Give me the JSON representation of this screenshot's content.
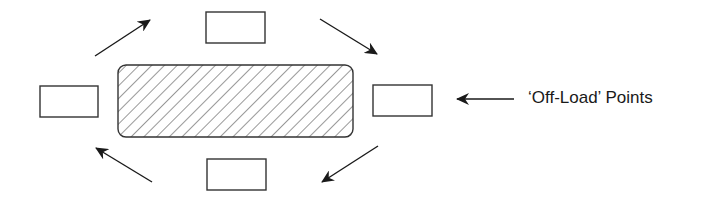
{
  "diagram": {
    "title": "",
    "label": "‘Off-Load’ Points",
    "colors": {
      "stroke": "#333333",
      "hatch": "#444444",
      "background": "#ffffff"
    },
    "central_area": {
      "x": 118,
      "y": 65,
      "width": 235,
      "height": 72,
      "radius": 8,
      "fill": "diagonal-hatch"
    },
    "offload_points": [
      {
        "id": "top",
        "x": 206,
        "y": 12,
        "width": 59,
        "height": 31
      },
      {
        "id": "left",
        "x": 40,
        "y": 86,
        "width": 58,
        "height": 31
      },
      {
        "id": "right",
        "x": 373,
        "y": 85,
        "width": 59,
        "height": 31
      },
      {
        "id": "bottom",
        "x": 207,
        "y": 159,
        "width": 59,
        "height": 31
      }
    ],
    "flow_arrows": [
      {
        "id": "top-left",
        "x1": 95,
        "y1": 56,
        "x2": 150,
        "y2": 20
      },
      {
        "id": "top-right",
        "x1": 320,
        "y1": 19,
        "x2": 377,
        "y2": 54
      },
      {
        "id": "bottom-right",
        "x1": 378,
        "y1": 146,
        "x2": 322,
        "y2": 182
      },
      {
        "id": "bottom-left",
        "x1": 152,
        "y1": 182,
        "x2": 96,
        "y2": 148
      }
    ],
    "label_arrow": {
      "x1": 514,
      "y1": 99,
      "x2": 457,
      "y2": 99
    }
  }
}
